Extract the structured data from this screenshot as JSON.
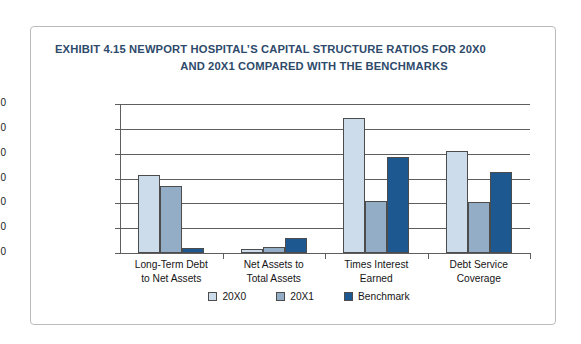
{
  "figure": {
    "exhibit_label": "EXHIBIT 4.15",
    "title_line_1": "EXHIBIT 4.15  NEWPORT HOSPITAL’S CAPITAL STRUCTURE RATIOS FOR 20X0",
    "title_line_2": "AND 20X1 COMPARED WITH THE BENCHMARKS",
    "title_color": "#2e4a6b",
    "border_color": "#b9bcbe"
  },
  "chart_data": {
    "type": "bar",
    "title": "EXHIBIT 4.15  NEWPORT HOSPITAL’S CAPITAL STRUCTURE RATIOS FOR 20X0 AND 20X1 COMPARED WITH THE BENCHMARKS",
    "xlabel": "",
    "ylabel": "",
    "ylim": [
      0.0,
      6.0
    ],
    "ytick_step": 1.0,
    "ytick_labels": [
      "0.0",
      "1.0",
      "2.0",
      "3.0",
      "4.0",
      "5.0",
      "6.0"
    ],
    "grid": true,
    "grid_axis": "y",
    "legend_position": "bottom-center",
    "categories": [
      "Long-Term Debt to Net Assets",
      "Net Assets to Total Assets",
      "Times Interest Earned",
      "Debt Service Coverage"
    ],
    "category_lines": [
      [
        "Long-Term Debt",
        "to Net Assets"
      ],
      [
        "Net Assets to",
        "Total Assets"
      ],
      [
        "Times Interest",
        "Earned"
      ],
      [
        "Debt Service",
        "Coverage"
      ]
    ],
    "series": [
      {
        "name": "20X0",
        "color": "#ccdceb",
        "values": [
          3.15,
          0.15,
          5.45,
          4.1
        ]
      },
      {
        "name": "20X1",
        "color": "#93adc6",
        "values": [
          2.7,
          0.25,
          2.1,
          2.05
        ]
      },
      {
        "name": "Benchmark",
        "color": "#1e5891",
        "values": [
          0.2,
          0.6,
          3.85,
          3.25
        ]
      }
    ]
  }
}
